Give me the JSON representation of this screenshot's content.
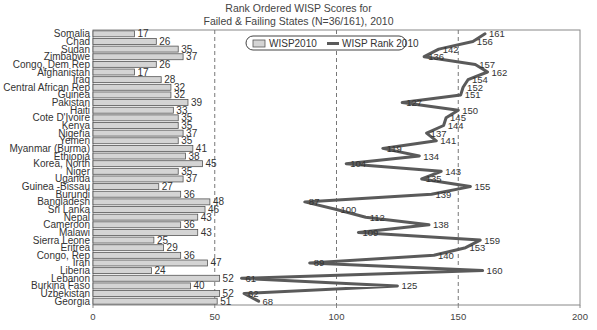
{
  "title_line1": "Rank Ordered WISP Scores for",
  "title_line2": "Failed & Failing States (N=36/161), 2010",
  "legend": {
    "bar_label": "WISP2010",
    "line_label": "WISP Rank 2010"
  },
  "colors": {
    "bar_fill": "#d4d4d4",
    "bar_stroke": "#555555",
    "line": "#5a5a5a",
    "grid_dash": "#777777",
    "frame": "#888888"
  },
  "chart_data": {
    "type": "bar+line",
    "title": "Rank Ordered WISP Scores for Failed & Failing States (N=36/161), 2010",
    "orientation": "horizontal",
    "xlabel": "",
    "ylabel": "",
    "xlim": [
      0,
      200
    ],
    "xticks": [
      0,
      50,
      100,
      150,
      200
    ],
    "grid": "vertical dashed at 50, 100, 150",
    "legend_position": "top-center",
    "categories": [
      "Somalia",
      "Chad",
      "Sudan",
      "Zimbabwe",
      "Congo, Dem Rep",
      "Afghanistan",
      "Iraq",
      "Central African Rep",
      "Guinea",
      "Pakistan",
      "Haiti",
      "Cote D'Ivoire",
      "Kenya",
      "Nigeria",
      "Yemen",
      "Myanmar (Burma)",
      "Ethiopia",
      "Korea, North",
      "Niger",
      "Uganda",
      "Guinea -Bissau",
      "Burundi",
      "Bangladesh",
      "Sri Lanka",
      "Nepal",
      "Cameroon",
      "Malawi",
      "Sierra Leone",
      "Eritrea",
      "Congo, Rep",
      "Iran",
      "Liberia",
      "Lebanon",
      "Burkina Faso",
      "Uzbekistan",
      "Georgia"
    ],
    "series": [
      {
        "name": "WISP2010",
        "type": "bar",
        "values": [
          17,
          26,
          35,
          37,
          26,
          17,
          28,
          32,
          32,
          39,
          33,
          35,
          35,
          37,
          35,
          41,
          38,
          45,
          35,
          37,
          27,
          36,
          48,
          46,
          43,
          36,
          43,
          25,
          29,
          36,
          47,
          24,
          52,
          40,
          52,
          51
        ]
      },
      {
        "name": "WISP Rank 2010",
        "type": "line",
        "values": [
          161,
          156,
          142,
          136,
          157,
          162,
          154,
          152,
          151,
          127,
          150,
          145,
          144,
          137,
          141,
          119,
          134,
          104,
          143,
          135,
          155,
          139,
          87,
          100,
          112,
          138,
          109,
          159,
          153,
          140,
          89,
          160,
          61,
          125,
          62,
          68
        ]
      }
    ]
  }
}
